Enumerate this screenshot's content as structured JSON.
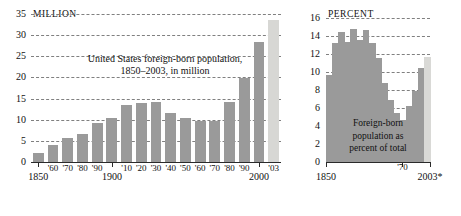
{
  "chart_data": [
    {
      "id": "foreign-born-absolute",
      "type": "bar",
      "title": "United States foreign-born population, 1850–2003, in million",
      "title_line1": "United States foreign-born population,",
      "title_line2": "1850–2003, in million",
      "unit_label": "MILLION",
      "xlabel": "",
      "ylabel": "MILLION",
      "ylim": [
        0,
        35
      ],
      "yticks": [
        0,
        5,
        10,
        15,
        20,
        25,
        30,
        35
      ],
      "ytick_labels": [
        "0",
        "5",
        "10",
        "15",
        "20",
        "25",
        "30",
        "35"
      ],
      "grid": true,
      "legend": "none",
      "categories": [
        "1850",
        "'60",
        "'70",
        "'80",
        "'90",
        "1900",
        "'10",
        "'20",
        "'30",
        "'40",
        "'50",
        "'60",
        "'70",
        "'80",
        "'90",
        "2000",
        "'03"
      ],
      "values": [
        2.2,
        4.1,
        5.6,
        6.7,
        9.2,
        10.3,
        13.5,
        13.9,
        14.2,
        11.6,
        10.3,
        9.7,
        9.6,
        14.1,
        19.8,
        28.4,
        33.5
      ],
      "bar_colors": [
        "#9a9a9a",
        "#9a9a9a",
        "#9a9a9a",
        "#9a9a9a",
        "#9a9a9a",
        "#9a9a9a",
        "#9a9a9a",
        "#9a9a9a",
        "#9a9a9a",
        "#9a9a9a",
        "#9a9a9a",
        "#9a9a9a",
        "#9a9a9a",
        "#9a9a9a",
        "#9a9a9a",
        "#9a9a9a",
        "#d7d7d4"
      ],
      "axis_tick_labels": [
        {
          "label": "1850",
          "category": "1850",
          "emphasis": "major"
        },
        {
          "label": "'60",
          "category": "'60",
          "emphasis": "minor"
        },
        {
          "label": "'70",
          "category": "'70",
          "emphasis": "minor"
        },
        {
          "label": "'80",
          "category": "'80",
          "emphasis": "minor"
        },
        {
          "label": "'90",
          "category": "'90",
          "emphasis": "minor"
        },
        {
          "label": "1900",
          "category": "1900",
          "emphasis": "major"
        },
        {
          "label": "'10",
          "category": "'10",
          "emphasis": "minor"
        },
        {
          "label": "'20",
          "category": "'20",
          "emphasis": "minor"
        },
        {
          "label": "'30",
          "category": "'30",
          "emphasis": "minor"
        },
        {
          "label": "'40",
          "category": "'40",
          "emphasis": "minor"
        },
        {
          "label": "'50",
          "category": "'50",
          "emphasis": "minor"
        },
        {
          "label": "'60",
          "category": "'60",
          "emphasis": "minor"
        },
        {
          "label": "'70",
          "category": "'70",
          "emphasis": "minor"
        },
        {
          "label": "'80",
          "category": "'80",
          "emphasis": "minor"
        },
        {
          "label": "'90",
          "category": "'90",
          "emphasis": "minor"
        },
        {
          "label": "2000",
          "category": "2000",
          "emphasis": "major"
        },
        {
          "label": "'03",
          "category": "'03",
          "emphasis": "minor"
        }
      ]
    },
    {
      "id": "foreign-born-percent",
      "type": "area",
      "title": "Foreign-born population as percent of total",
      "caption_line1": "Foreign-born",
      "caption_line2": "population as",
      "caption_line3": "percent of total",
      "unit_label": "PERCENT",
      "xlabel": "",
      "ylabel": "PERCENT",
      "ylim": [
        0,
        16
      ],
      "yticks": [
        0,
        2,
        4,
        6,
        8,
        10,
        12,
        14,
        16
      ],
      "ytick_labels": [
        "0",
        "2",
        "4",
        "6",
        "8",
        "10",
        "12",
        "14",
        "16"
      ],
      "grid": true,
      "legend": "none",
      "x": [
        "1850",
        "1860",
        "1870",
        "1880",
        "1890",
        "1900",
        "1910",
        "1920",
        "1930",
        "1940",
        "1950",
        "1960",
        "1970",
        "1980",
        "1990",
        "2000",
        "2003"
      ],
      "values": [
        9.7,
        13.2,
        14.4,
        13.3,
        14.8,
        13.6,
        14.7,
        13.2,
        11.6,
        8.8,
        6.9,
        5.4,
        4.7,
        6.2,
        7.9,
        10.4,
        11.7
      ],
      "last_segment_color": "#d9d9d6",
      "area_color": "#9a9a9a",
      "axis_tick_labels": [
        {
          "label": "1850",
          "x": "1850"
        },
        {
          "label": "'70",
          "x": "1970"
        },
        {
          "label": "2003*",
          "x": "2003"
        }
      ]
    }
  ]
}
